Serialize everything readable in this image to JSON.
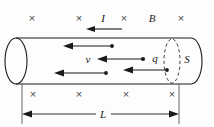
{
  "figure": {
    "colors": {
      "ink": "#1a1a1a",
      "light_ink": "#555555",
      "cross_mark": "#4a4a4a",
      "background": "#fdfdfd"
    },
    "labels": {
      "current": "I",
      "magnetic_field": "B",
      "velocity": "v",
      "charge": "q",
      "cross_section": "S",
      "length": "L"
    },
    "cross_symbol": "×",
    "field_marks_top": [
      {
        "symbol": "×",
        "x": 32,
        "y": 22
      },
      {
        "symbol": "×",
        "x": 79,
        "y": 22
      },
      {
        "symbol": "×",
        "x": 124,
        "y": 22
      },
      {
        "symbol": "×",
        "x": 181,
        "y": 22
      }
    ],
    "field_marks_bottom": [
      {
        "symbol": "×",
        "x": 33,
        "y": 98
      },
      {
        "symbol": "×",
        "x": 79,
        "y": 98
      },
      {
        "symbol": "×",
        "x": 126,
        "y": 98
      },
      {
        "symbol": "×",
        "x": 172,
        "y": 98
      }
    ],
    "label_positions": {
      "current": {
        "x": 103,
        "y": 22
      },
      "magnetic_field": {
        "x": 152,
        "y": 22
      },
      "velocity": {
        "x": 88,
        "y": 62
      },
      "charge": {
        "x": 155,
        "y": 60
      },
      "cross_section": {
        "x": 187,
        "y": 60
      },
      "length": {
        "x": 103,
        "y": 118
      }
    },
    "drift_arrows": [
      {
        "name": "drift-arrow-top",
        "x_tail": 112,
        "x_head": 64,
        "y": 46
      },
      {
        "name": "drift-arrow-middle",
        "x_tail": 143,
        "x_head": 98,
        "y": 59
      },
      {
        "name": "drift-arrow-lower",
        "x_tail": 106,
        "x_head": 55,
        "y": 73
      },
      {
        "name": "drift-arrow-lower-right",
        "x_tail": 167,
        "x_head": 124,
        "y": 70
      }
    ],
    "current_arrow": {
      "x_tail": 122,
      "x_head": 86,
      "y": 29
    },
    "cylinder": {
      "left_x": 16,
      "right_x": 190,
      "top_y": 38,
      "bottom_y": 84,
      "cap_rx": 11,
      "cap_ry": 23,
      "section_x": 172,
      "section_rx": 8,
      "section_ry": 22
    },
    "dimension_line": {
      "x_start": 22,
      "x_end": 179,
      "y": 114
    }
  }
}
